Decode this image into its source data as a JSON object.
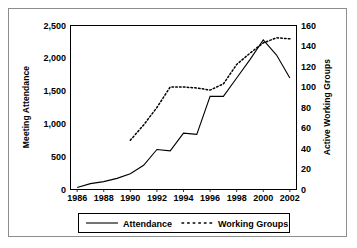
{
  "chart_data": {
    "type": "line",
    "title": "",
    "xlabel": "",
    "x": [
      1986,
      1987,
      1988,
      1989,
      1990,
      1991,
      1992,
      1993,
      1994,
      1995,
      1996,
      1997,
      1998,
      1999,
      2000,
      2001,
      2002
    ],
    "xlim": [
      1985.5,
      2002.5
    ],
    "xticks": [
      1986,
      1988,
      1990,
      1992,
      1994,
      1996,
      1998,
      2000,
      2002
    ],
    "xtick_labels": [
      "1986",
      "1988",
      "1990",
      "1992",
      "1994",
      "1996",
      "1998",
      "2000",
      "2002"
    ],
    "grid": false,
    "legend_position": "bottom-outside",
    "axes": [
      {
        "id": "left",
        "label": "Meeting Attendance",
        "ylim": [
          0,
          2500
        ],
        "yticks": [
          0,
          500,
          1000,
          1500,
          2000,
          2500
        ],
        "ytick_labels": [
          "0",
          "500",
          "1,000",
          "1,500",
          "2,000",
          "2,500"
        ]
      },
      {
        "id": "right",
        "label": "Active Working Groups",
        "ylim": [
          0,
          160
        ],
        "yticks": [
          0,
          20,
          40,
          60,
          80,
          100,
          120,
          140,
          160
        ],
        "ytick_labels": [
          "0",
          "20",
          "40",
          "60",
          "80",
          "100",
          "120",
          "140",
          "160"
        ]
      }
    ],
    "series": [
      {
        "name": "Attendance",
        "axis": "left",
        "style": "solid",
        "color": "#000000",
        "x": [
          1986,
          1987,
          1988,
          1989,
          1990,
          1991,
          1992,
          1993,
          1994,
          1995,
          1996,
          1997,
          1998,
          1999,
          2000,
          2001,
          2002
        ],
        "values": [
          30,
          90,
          120,
          170,
          240,
          370,
          610,
          590,
          860,
          840,
          1420,
          1420,
          1700,
          1980,
          2280,
          2050,
          1700
        ]
      },
      {
        "name": "Working Groups",
        "axis": "right",
        "style": "dotted",
        "color": "#000000",
        "x": [
          1990,
          1991,
          1992,
          1993,
          1994,
          1995,
          1996,
          1997,
          1998,
          1999,
          2000,
          2001,
          2002
        ],
        "values": [
          48,
          63,
          80,
          100,
          100,
          99,
          97,
          103,
          122,
          133,
          143,
          148,
          147
        ]
      }
    ]
  },
  "legend": {
    "items": [
      {
        "label": "Attendance",
        "style": "solid"
      },
      {
        "label": "Working Groups",
        "style": "dotted"
      }
    ]
  }
}
